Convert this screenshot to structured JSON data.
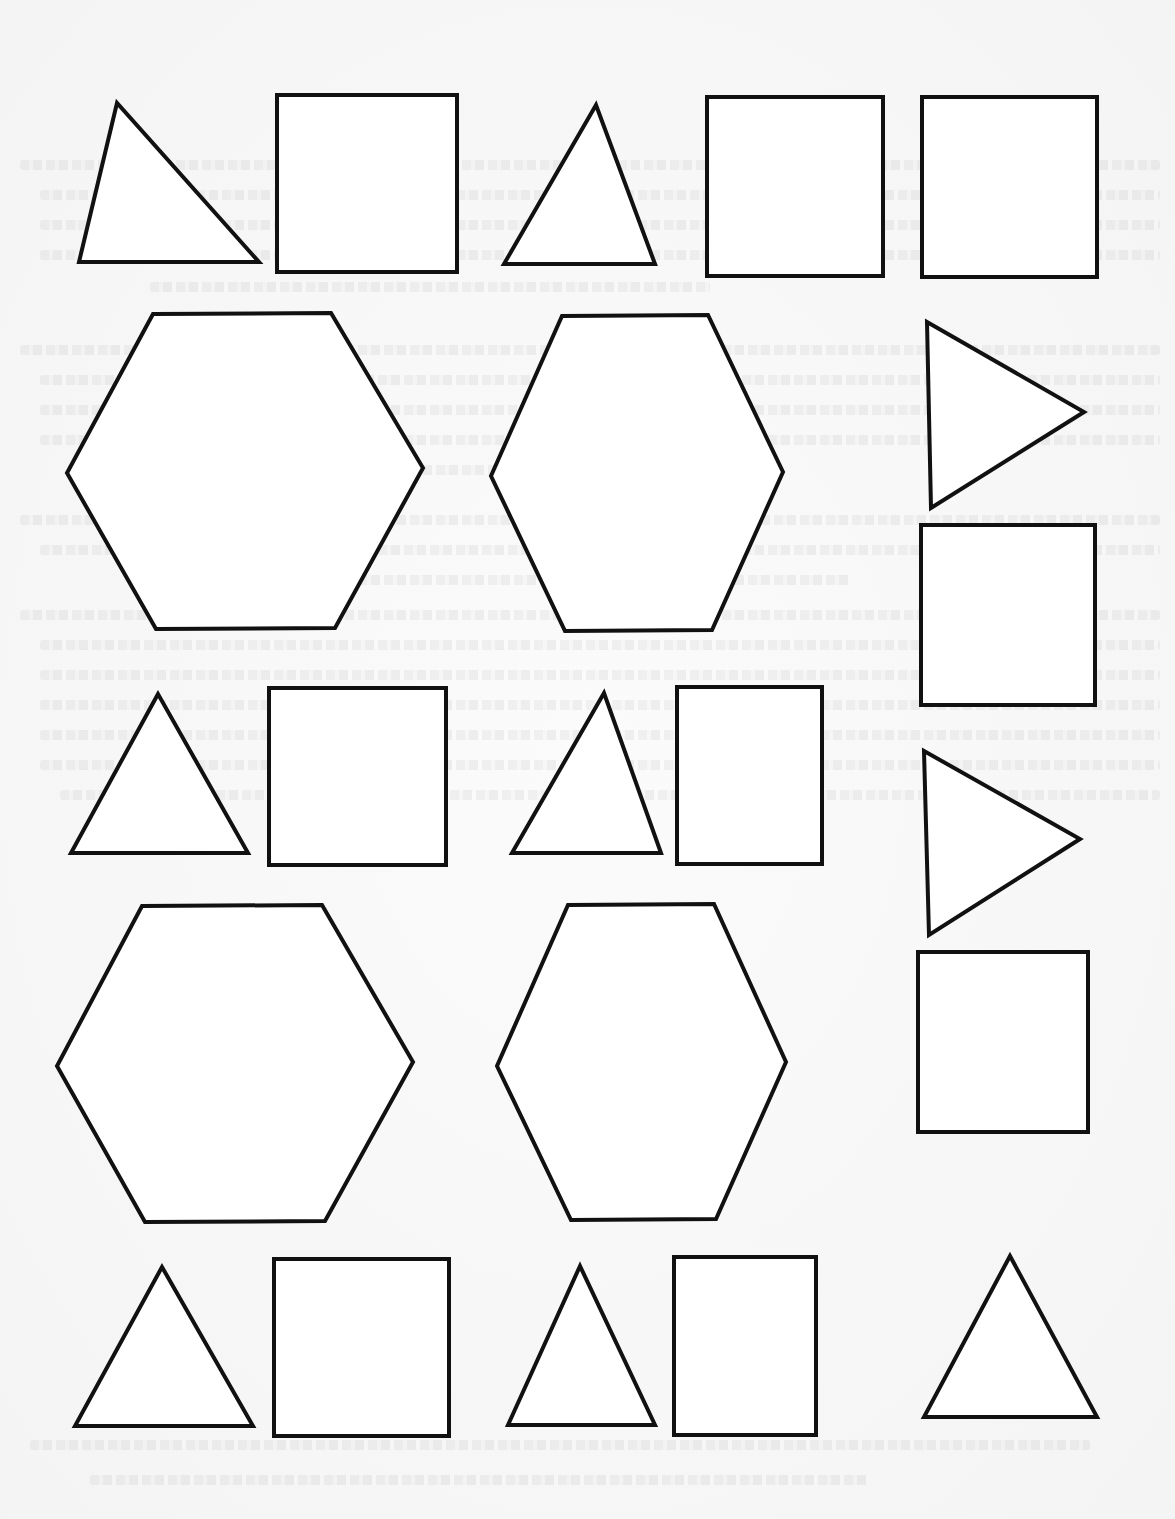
{
  "page": {
    "background": "#f7f7f7",
    "stroke_color": "#111111",
    "fill_color": "#ffffff"
  },
  "shapes": [
    {
      "id": "triangle-1",
      "type": "triangle",
      "orientation": "up",
      "points": "117,103 79,262 259,262"
    },
    {
      "id": "square-1",
      "type": "square",
      "points": "277,95 457,95 457,272 277,272"
    },
    {
      "id": "triangle-2",
      "type": "triangle",
      "orientation": "up",
      "points": "596,105 504,264 655,264"
    },
    {
      "id": "square-2",
      "type": "square",
      "points": "707,97 883,97 883,276 707,276"
    },
    {
      "id": "triangle-flip",
      "type": "triangle",
      "orientation": "none",
      "points": "0,0 0,0 0,0"
    },
    {
      "id": "square-3",
      "type": "square",
      "points": "922,97 1097,97 1097,277 922,277"
    },
    {
      "id": "hexagon-1",
      "type": "hexagon",
      "points": "153,314 331,313 423,468 335,628 156,629 67,473"
    },
    {
      "id": "hexagon-2",
      "type": "hexagon",
      "points": "562,316 708,315 783,472 712,630 565,631 491,476"
    },
    {
      "id": "triangle-right-1",
      "type": "triangle",
      "orientation": "right",
      "points": "927,322 1084,412 931,508"
    },
    {
      "id": "square-4",
      "type": "square",
      "points": "921,525 1095,525 1095,705 921,705"
    },
    {
      "id": "triangle-3",
      "type": "triangle",
      "orientation": "up",
      "points": "158,694 71,853 248,853"
    },
    {
      "id": "square-5",
      "type": "square",
      "points": "269,688 446,688 446,865 269,865"
    },
    {
      "id": "triangle-4",
      "type": "triangle",
      "orientation": "up",
      "points": "604,693 512,853 661,853"
    },
    {
      "id": "square-6",
      "type": "square",
      "points": "677,687 822,687 822,864 677,864"
    },
    {
      "id": "triangle-right-2",
      "type": "triangle",
      "orientation": "right",
      "points": "924,751 1080,839 929,935"
    },
    {
      "id": "hexagon-3",
      "type": "hexagon",
      "points": "142,906 322,905 413,1062 325,1221 145,1222 57,1066"
    },
    {
      "id": "hexagon-4",
      "type": "hexagon",
      "points": "568,905 714,904 786,1062 716,1219 571,1220 497,1066"
    },
    {
      "id": "square-7",
      "type": "square",
      "points": "918,952 1088,952 1088,1132 918,1132"
    },
    {
      "id": "triangle-5",
      "type": "triangle",
      "orientation": "up",
      "points": "162,1267 75,1426 253,1426"
    },
    {
      "id": "square-8",
      "type": "square",
      "points": "274,1259 449,1259 449,1436 274,1436"
    },
    {
      "id": "triangle-6",
      "type": "triangle",
      "orientation": "up",
      "points": "580,1266 508,1425 655,1425"
    },
    {
      "id": "square-9",
      "type": "square",
      "points": "674,1257 816,1257 816,1435 674,1435"
    },
    {
      "id": "triangle-7",
      "type": "triangle",
      "orientation": "up",
      "points": "1010,1256 924,1417 1097,1417"
    }
  ]
}
